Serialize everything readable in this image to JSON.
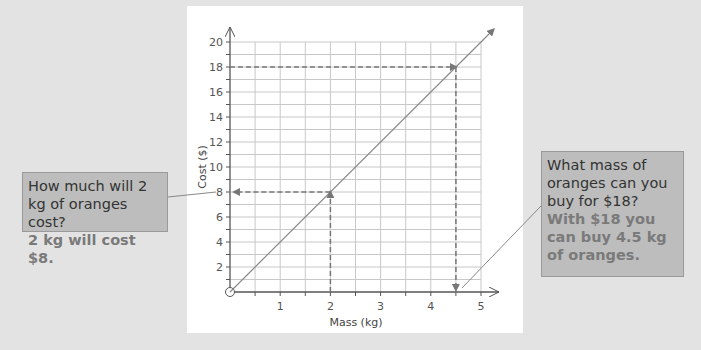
{
  "colors": {
    "background": "#e3e3e3",
    "card": "#ffffff",
    "grid": "#c8c8c8",
    "axis": "#555555",
    "line": "#8a8a8a",
    "dashed": "#777777",
    "callout_bg": "#bdbdbd",
    "answer_text": "#7a7a7a"
  },
  "callouts": {
    "left": {
      "question": "How much will 2 kg of oranges cost?",
      "answer": "2 kg will cost $8."
    },
    "right": {
      "question": "What mass of oranges can you buy for $18?",
      "answer": "With $18 you can buy 4.5 kg of oranges."
    }
  },
  "chart_data": {
    "type": "line",
    "title": "",
    "xlabel": "Mass (kg)",
    "ylabel": "Cost ($)",
    "xlim": [
      0,
      5
    ],
    "ylim": [
      0,
      20
    ],
    "x_ticks": [
      "1",
      "2",
      "3",
      "4",
      "5"
    ],
    "y_ticks": [
      "2",
      "4",
      "6",
      "8",
      "10",
      "12",
      "14",
      "16",
      "18",
      "20"
    ],
    "grid": true,
    "grid_minor_x": 0.5,
    "grid_minor_y": 1,
    "origin_label": "O",
    "series": [
      {
        "name": "Cost of oranges",
        "x": [
          0,
          1,
          2,
          3,
          4,
          4.5,
          5
        ],
        "y": [
          0,
          4,
          8,
          12,
          16,
          18,
          20
        ]
      }
    ],
    "annotations": [
      {
        "type": "dashed-arrow",
        "from": [
          2,
          0
        ],
        "to": [
          2,
          8
        ],
        "description": "up from 2 kg to line"
      },
      {
        "type": "dashed-arrow",
        "from": [
          2,
          8
        ],
        "to": [
          0,
          8
        ],
        "description": "left to $8"
      },
      {
        "type": "dashed-arrow",
        "from": [
          0,
          18
        ],
        "to": [
          4.5,
          18
        ],
        "description": "right from $18 to line"
      },
      {
        "type": "dashed-arrow",
        "from": [
          4.5,
          18
        ],
        "to": [
          4.5,
          0
        ],
        "description": "down to 4.5 kg"
      }
    ]
  }
}
